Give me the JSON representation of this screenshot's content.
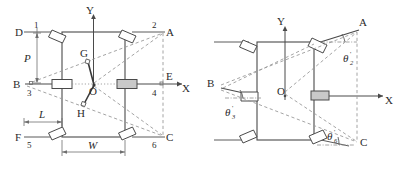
{
  "figure": {
    "type": "engineering-diagram",
    "panels": [
      {
        "id": "left",
        "name": "straight-configuration",
        "axes": {
          "x_label": "X",
          "y_label": "Y",
          "origin_label": "O"
        },
        "point_labels": [
          "D",
          "A",
          "B",
          "E",
          "F",
          "C",
          "G",
          "H",
          "O"
        ],
        "wheel_numbers": [
          "1",
          "2",
          "3",
          "4",
          "5",
          "6"
        ],
        "dimensions": [
          {
            "name": "P",
            "label": "P",
            "orientation": "vertical"
          },
          {
            "name": "L",
            "label": "L",
            "orientation": "horizontal"
          },
          {
            "name": "W",
            "label": "W",
            "orientation": "horizontal"
          }
        ]
      },
      {
        "id": "right",
        "name": "steered-configuration",
        "axes": {
          "x_label": "X",
          "y_label": "Y",
          "origin_label": "O"
        },
        "point_labels": [
          "A",
          "B",
          "C",
          "O"
        ],
        "angles": [
          {
            "name": "theta-2-prime",
            "symbol": "θ",
            "sub": "2",
            "prime": "'"
          },
          {
            "name": "theta-3-prime",
            "symbol": "θ",
            "sub": "3",
            "prime": "'"
          },
          {
            "name": "theta-6-prime",
            "symbol": "θ",
            "sub": "6",
            "prime": "'"
          }
        ]
      }
    ],
    "colors": {
      "body_line": "#4a4a4a",
      "thin_line": "#6e6e6e",
      "dashed_line": "#9a9a9a",
      "dotted_line": "#9a9a9a",
      "text": "#2b2b2b",
      "background": "#ffffff"
    }
  }
}
